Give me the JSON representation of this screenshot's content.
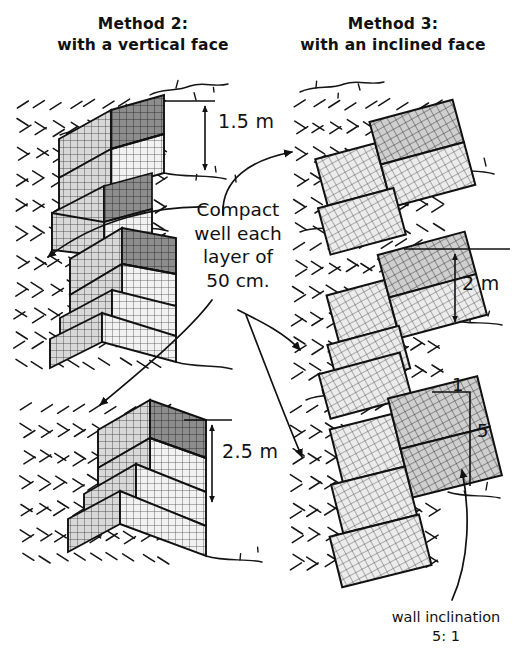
{
  "page": {
    "bg_color": "#ffffff",
    "ink_color": "#111111",
    "width": 520,
    "height": 661
  },
  "headers": {
    "method2": {
      "line1": "Method 2:",
      "line2": "with a vertical face"
    },
    "method3": {
      "line1": "Method 3:",
      "line2": "with an inclined face"
    }
  },
  "center_note": {
    "line1": "Compact",
    "line2": "well each",
    "line3": "layer of",
    "line4": "50 cm."
  },
  "dimensions": {
    "height_top_left": "1.5 m",
    "height_bottom_left": "2.5 m",
    "height_middle_right": "2 m",
    "slope_run": "1",
    "slope_rise": "5"
  },
  "wall_inclination": {
    "label": "wall inclination",
    "ratio": "5: 1"
  },
  "drawings": {
    "left_column": [
      {
        "name": "gabion-wall-vertical-1.5m",
        "tiers": 2,
        "face": "vertical"
      },
      {
        "name": "gabion-wall-vertical-2m",
        "tiers": 3,
        "face": "vertical"
      },
      {
        "name": "gabion-wall-vertical-2.5m",
        "tiers": 3,
        "face": "vertical"
      }
    ],
    "right_column": [
      {
        "name": "gabion-wall-inclined-1.5m",
        "tiers": 2,
        "face": "inclined"
      },
      {
        "name": "gabion-wall-inclined-2m",
        "tiers": 3,
        "face": "inclined"
      },
      {
        "name": "gabion-wall-inclined-2.5m",
        "tiers": 3,
        "face": "inclined"
      }
    ]
  }
}
